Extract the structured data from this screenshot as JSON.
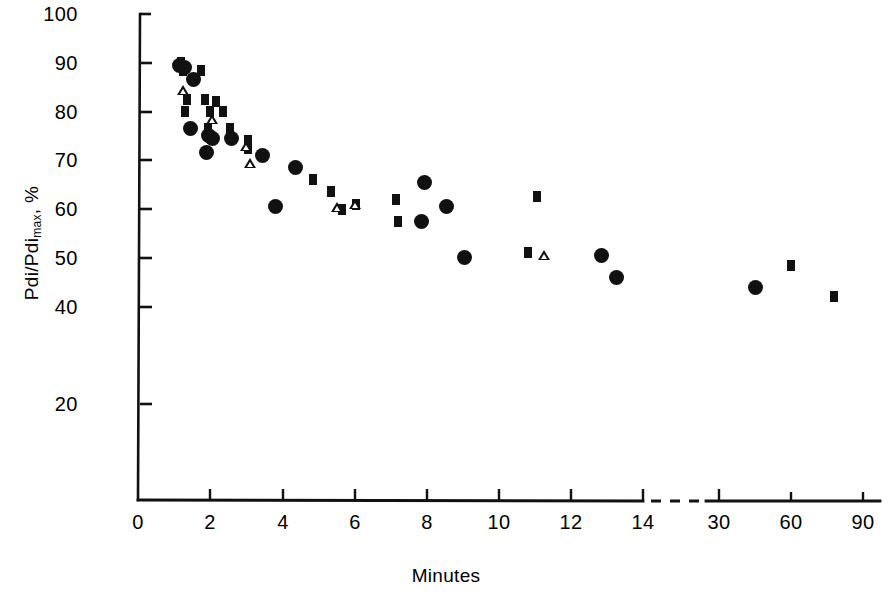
{
  "chart_data": {
    "type": "scatter",
    "title": "",
    "xlabel": "Minutes",
    "ylabel": "Pdi/Pdi max, %",
    "ylabel_base": "Pdi/Pdi",
    "ylabel_sub": "max",
    "ylabel_suffix": ", %",
    "xlim": [
      0,
      90
    ],
    "ylim": [
      0,
      100
    ],
    "grid": false,
    "legend": "none",
    "axis_break": {
      "present": true,
      "axis": "x",
      "between": [
        14,
        30
      ],
      "style": "dashed"
    },
    "xticks": [
      0,
      2,
      4,
      6,
      8,
      10,
      12,
      14,
      30,
      60,
      90
    ],
    "xtick_labels": [
      "0",
      "2",
      "4",
      "6",
      "8",
      "10",
      "12",
      "14",
      "30",
      "60",
      "90"
    ],
    "yticks": [
      20,
      40,
      50,
      60,
      70,
      80,
      90,
      100
    ],
    "ytick_labels": [
      "20",
      "40",
      "50",
      "60",
      "70",
      "80",
      "90",
      "100"
    ],
    "series": [
      {
        "name": "circle",
        "marker": "filled-circle",
        "color": "#111111",
        "points": [
          [
            1.15,
            89.5
          ],
          [
            1.3,
            89.0
          ],
          [
            1.55,
            86.5
          ],
          [
            1.45,
            76.5
          ],
          [
            1.95,
            75.0
          ],
          [
            2.05,
            74.5
          ],
          [
            1.9,
            71.5
          ],
          [
            2.6,
            74.5
          ],
          [
            3.45,
            71.0
          ],
          [
            4.35,
            68.5
          ],
          [
            3.8,
            60.5
          ],
          [
            7.95,
            65.5
          ],
          [
            7.85,
            57.5
          ],
          [
            8.55,
            60.5
          ],
          [
            9.05,
            50.0
          ],
          [
            12.85,
            50.5
          ],
          [
            13.25,
            46.0
          ],
          [
            45.0,
            44.0
          ]
        ]
      },
      {
        "name": "square",
        "marker": "filled-square",
        "color": "#111111",
        "points": [
          [
            1.2,
            90.0
          ],
          [
            1.25,
            88.5
          ],
          [
            1.75,
            88.5
          ],
          [
            1.35,
            82.5
          ],
          [
            1.85,
            82.5
          ],
          [
            2.15,
            82.0
          ],
          [
            1.3,
            80.0
          ],
          [
            2.0,
            80.0
          ],
          [
            2.35,
            80.0
          ],
          [
            1.95,
            76.5
          ],
          [
            2.55,
            76.5
          ],
          [
            3.05,
            74.0
          ],
          [
            3.05,
            72.5
          ],
          [
            4.85,
            66.0
          ],
          [
            5.35,
            63.5
          ],
          [
            5.65,
            60.0
          ],
          [
            6.05,
            61.0
          ],
          [
            7.15,
            62.0
          ],
          [
            7.2,
            57.5
          ],
          [
            11.05,
            62.5
          ],
          [
            10.8,
            51.0
          ],
          [
            60.0,
            48.5
          ],
          [
            78.0,
            42.0
          ]
        ]
      },
      {
        "name": "triangle",
        "marker": "open-triangle",
        "color": "#111111",
        "points": [
          [
            1.25,
            84.5
          ],
          [
            2.05,
            78.5
          ],
          [
            3.0,
            73.0
          ],
          [
            3.1,
            69.5
          ],
          [
            5.5,
            60.5
          ],
          [
            6.0,
            61.0
          ],
          [
            11.25,
            50.5
          ]
        ]
      }
    ]
  },
  "axis": {
    "y_axis_name": "y-axis",
    "x_axis_name": "x-axis"
  }
}
